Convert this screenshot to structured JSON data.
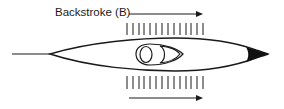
{
  "diagram": {
    "label": "Backstroke (B)",
    "colors": {
      "stroke": "#1a1a1a",
      "background": "#ffffff"
    },
    "top_arrow": {
      "x1": 129,
      "x2": 203,
      "y": 14
    },
    "bottom_arrow": {
      "x1": 129,
      "x2": 203,
      "y": 98
    },
    "top_hatch": {
      "count": 14,
      "x_start": 127,
      "x_end": 203,
      "y1": 23,
      "y2": 35
    },
    "bottom_hatch": {
      "count": 14,
      "x_start": 127,
      "x_end": 203,
      "y1": 76,
      "y2": 89
    }
  }
}
